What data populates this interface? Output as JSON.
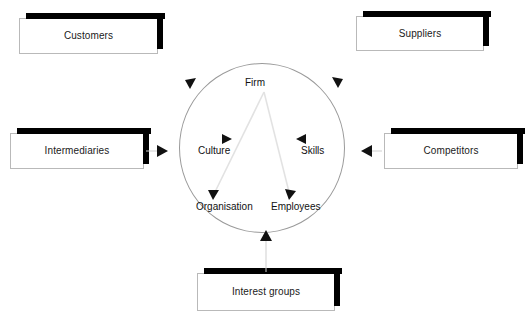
{
  "diagram": {
    "type": "influence-diagram",
    "center": {
      "shape": "circle",
      "nodes": [
        {
          "id": "firm",
          "label": "Firm"
        },
        {
          "id": "culture",
          "label": "Culture"
        },
        {
          "id": "skills",
          "label": "Skills"
        },
        {
          "id": "organisation",
          "label": "Organisation"
        },
        {
          "id": "employees",
          "label": "Employees"
        }
      ],
      "internal_connections": [
        {
          "from": "firm",
          "to": "organisation",
          "arrow": "down"
        },
        {
          "from": "firm",
          "to": "employees",
          "arrow": "down"
        },
        {
          "from": "firm",
          "to": "culture",
          "arrow": "right"
        },
        {
          "from": "firm",
          "to": "skills",
          "arrow": "left"
        }
      ]
    },
    "external_boxes": [
      {
        "id": "customers",
        "label": "Customers",
        "position": "top-left",
        "arrow_direction": "up-right"
      },
      {
        "id": "suppliers",
        "label": "Suppliers",
        "position": "top-right",
        "arrow_direction": "up-left"
      },
      {
        "id": "intermediaries",
        "label": "Intermediaries",
        "position": "left",
        "arrow_direction": "right"
      },
      {
        "id": "competitors",
        "label": "Competitors",
        "position": "right",
        "arrow_direction": "left"
      },
      {
        "id": "interest_groups",
        "label": "Interest groups",
        "position": "bottom-center",
        "arrow_direction": "up"
      }
    ],
    "colors": {
      "box_fill": "#ffffff",
      "box_border": "#b9b9b9",
      "box_shadow": "#000000",
      "circle_stroke": "#9a9a9a",
      "arrow_fill": "#111111",
      "text": "#1a1a1a"
    }
  }
}
